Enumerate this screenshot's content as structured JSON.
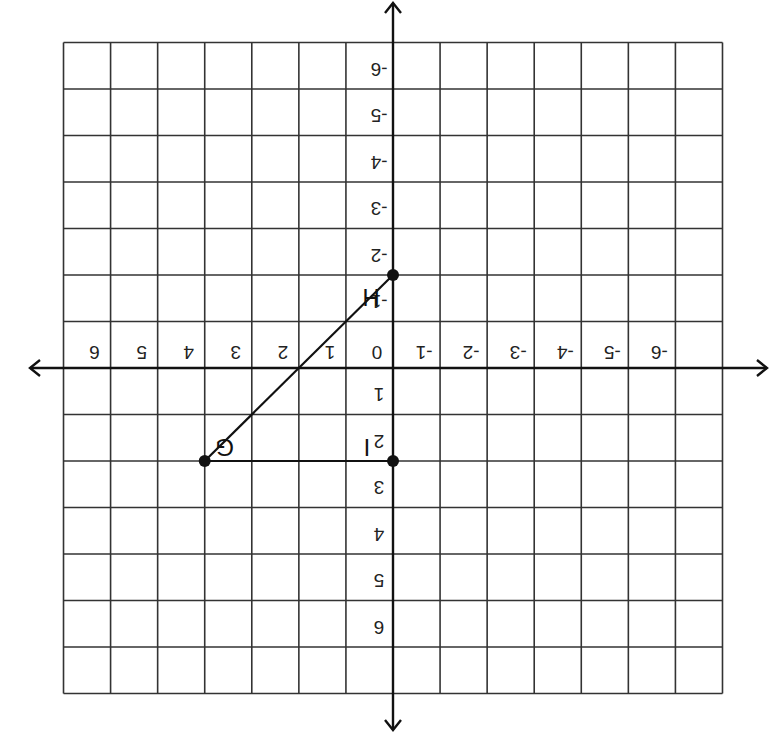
{
  "figure": {
    "orientation": "rotated-180",
    "grid": {
      "xmin": -7,
      "xmax": 7,
      "ymin": -7,
      "ymax": 7
    },
    "x_tick_labels": [
      "-6",
      "-5",
      "-4",
      "-3",
      "-2",
      "-1",
      "0",
      "1",
      "2",
      "3",
      "4",
      "5",
      "6"
    ],
    "y_tick_labels": [
      "-6",
      "-5",
      "-4",
      "-3",
      "-2",
      "-1",
      "1",
      "2",
      "3",
      "4",
      "5",
      "6"
    ],
    "colors": {
      "grid": "#333333",
      "axis": "#111111",
      "point": "#111111",
      "background": "#ffffff"
    }
  },
  "points": [
    {
      "name": "G",
      "x": 4,
      "y": 2
    },
    {
      "name": "I",
      "x": 0,
      "y": 2
    },
    {
      "name": "H",
      "x": 0,
      "y": -2
    }
  ],
  "segments": [
    {
      "from": "G",
      "to": "I"
    },
    {
      "from": "G",
      "to": "H"
    }
  ]
}
